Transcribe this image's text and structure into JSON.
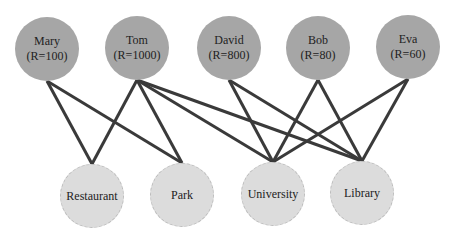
{
  "diagram": {
    "type": "bipartite-graph",
    "edge_color": "#3a3a3a",
    "person_fill": "#a6a6a6",
    "place_fill": "#dcdcdc",
    "persons": [
      {
        "id": "mary",
        "name": "Mary",
        "r_label": "(R=100)",
        "x": 47,
        "y": 49
      },
      {
        "id": "tom",
        "name": "Tom",
        "r_label": "(R=1000)",
        "x": 137,
        "y": 48
      },
      {
        "id": "david",
        "name": "David",
        "r_label": "(R=800)",
        "x": 229,
        "y": 48
      },
      {
        "id": "bob",
        "name": "Bob",
        "r_label": "(R=80)",
        "x": 318,
        "y": 48
      },
      {
        "id": "eva",
        "name": "Eva",
        "r_label": "(R=60)",
        "x": 408,
        "y": 47
      }
    ],
    "places": [
      {
        "id": "restaurant",
        "name": "Restaurant",
        "x": 92,
        "y": 196
      },
      {
        "id": "park",
        "name": "Park",
        "x": 182,
        "y": 195
      },
      {
        "id": "university",
        "name": "University",
        "x": 273,
        "y": 194
      },
      {
        "id": "library",
        "name": "Library",
        "x": 362,
        "y": 193
      }
    ],
    "edges": [
      [
        "mary",
        "restaurant"
      ],
      [
        "mary",
        "park"
      ],
      [
        "tom",
        "restaurant"
      ],
      [
        "tom",
        "park"
      ],
      [
        "tom",
        "university"
      ],
      [
        "tom",
        "library"
      ],
      [
        "david",
        "university"
      ],
      [
        "david",
        "library"
      ],
      [
        "bob",
        "university"
      ],
      [
        "bob",
        "library"
      ],
      [
        "eva",
        "university"
      ],
      [
        "eva",
        "library"
      ]
    ]
  }
}
